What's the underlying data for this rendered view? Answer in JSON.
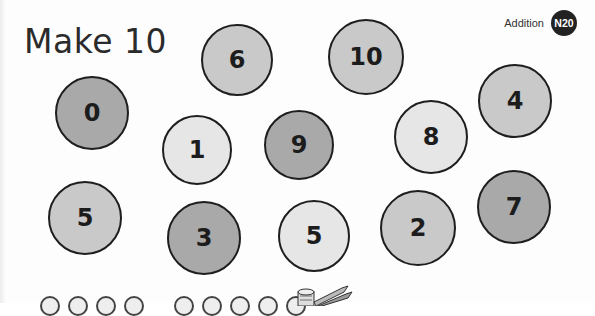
{
  "worksheet": {
    "title": "Make 10",
    "topic_label": "Addition",
    "badge": "N20"
  },
  "circles": [
    {
      "value": "6",
      "shade": "mid",
      "cx": 237,
      "cy": 60,
      "r": 36
    },
    {
      "value": "10",
      "shade": "mid",
      "cx": 366,
      "cy": 57,
      "r": 38
    },
    {
      "value": "0",
      "shade": "dark",
      "cx": 92,
      "cy": 113,
      "r": 37
    },
    {
      "value": "1",
      "shade": "light",
      "cx": 197,
      "cy": 150,
      "r": 35
    },
    {
      "value": "9",
      "shade": "dark",
      "cx": 299,
      "cy": 145,
      "r": 35
    },
    {
      "value": "8",
      "shade": "light",
      "cx": 431,
      "cy": 137,
      "r": 37
    },
    {
      "value": "4",
      "shade": "mid",
      "cx": 515,
      "cy": 101,
      "r": 37
    },
    {
      "value": "5",
      "shade": "mid",
      "cx": 85,
      "cy": 218,
      "r": 37
    },
    {
      "value": "3",
      "shade": "dark",
      "cx": 204,
      "cy": 238,
      "r": 37
    },
    {
      "value": "5",
      "shade": "light",
      "cx": 314,
      "cy": 236,
      "r": 36
    },
    {
      "value": "2",
      "shade": "mid",
      "cx": 418,
      "cy": 228,
      "r": 38
    },
    {
      "value": "7",
      "shade": "dark",
      "cx": 514,
      "cy": 207,
      "r": 37
    }
  ],
  "colors": {
    "light": "#e6e6e6",
    "mid": "#c9c9c9",
    "dark": "#a9a9a9",
    "badge_bg": "#222222"
  }
}
